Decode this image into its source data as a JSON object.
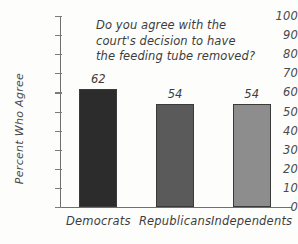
{
  "chart_data": {
    "type": "bar",
    "title": "Do you agree with the court's decision to have the feeding tube removed?",
    "title_lines": [
      "Do you agree with the",
      "court's decision to have",
      "the feeding tube removed?"
    ],
    "xlabel": "",
    "ylabel": "Percent Who Agree",
    "categories": [
      "Democrats",
      "Republicans",
      "Independents"
    ],
    "values": [
      62,
      54,
      54
    ],
    "value_labels": [
      "62",
      "54",
      "54"
    ],
    "ylim": [
      0,
      100
    ],
    "ytick_values": [
      0,
      10,
      20,
      30,
      40,
      50,
      60,
      70,
      80,
      90,
      100
    ],
    "ytick_labels": [
      "0",
      "10",
      "20",
      "30",
      "40",
      "50",
      "60",
      "70",
      "80",
      "90",
      "100"
    ],
    "grid": false,
    "legend": false,
    "bar_colors": [
      "#2c2c2c",
      "#5a5a5a",
      "#8d8d8d"
    ],
    "axis_color": "#6f6f6f",
    "text_color": "#3d3d3d",
    "background_color": "#fdfdfc"
  }
}
